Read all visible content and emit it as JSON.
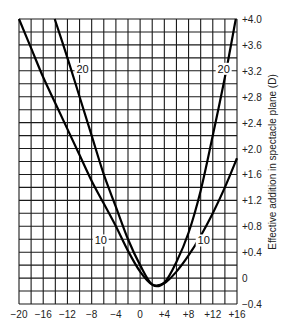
{
  "chart_data": {
    "type": "line",
    "title": "",
    "xlabel": "",
    "ylabel": "Effective addition in spectacle plane (D)",
    "xlim": [
      -20,
      16
    ],
    "ylim": [
      -0.4,
      4.0
    ],
    "grid": true,
    "x_grid_step": 2,
    "y_grid_step": 0.2,
    "x_ticks": [
      -20,
      -16,
      -12,
      -8,
      -4,
      0,
      4,
      8,
      12,
      16
    ],
    "x_tick_labels": [
      "−20",
      "−16",
      "−12",
      "−8",
      "−4",
      "0",
      "+4",
      "+8",
      "+12",
      "+16"
    ],
    "y_ticks": [
      4.0,
      3.6,
      3.2,
      2.8,
      2.4,
      2.0,
      1.6,
      1.2,
      0.8,
      0.4,
      0,
      -0.4
    ],
    "y_tick_labels": [
      "+4.0",
      "+3.6",
      "+3.2",
      "+2.8",
      "+2.4",
      "+2.0",
      "+1.6",
      "+1.2",
      "+0.8",
      "+0.4",
      "0",
      "−0.4"
    ],
    "y_axis_position": "right",
    "series": [
      {
        "name": "10",
        "label_pos": {
          "x": -6.5,
          "y": 0.55
        },
        "label_pos2": {
          "x": 10.5,
          "y": 0.55
        },
        "x": [
          -20,
          -18,
          -16,
          -14,
          -12,
          -10,
          -8,
          -6,
          -4,
          -2,
          0,
          2,
          4,
          6,
          8,
          10,
          12,
          14,
          16
        ],
        "values": [
          4.0,
          3.55,
          3.1,
          2.7,
          2.3,
          1.9,
          1.5,
          1.15,
          0.8,
          0.42,
          0.1,
          -0.1,
          -0.08,
          0.1,
          0.35,
          0.65,
          1.0,
          1.4,
          1.85
        ]
      },
      {
        "name": "20",
        "label_pos": {
          "x": -9.5,
          "y": 3.2
        },
        "label_pos2": {
          "x": 13.8,
          "y": 3.2
        },
        "x": [
          -14.1,
          -12,
          -10,
          -8,
          -6,
          -4,
          -2,
          0,
          2,
          4,
          6,
          8,
          10,
          12,
          14,
          15.8
        ],
        "values": [
          4.0,
          3.4,
          2.8,
          2.2,
          1.6,
          1.1,
          0.6,
          0.2,
          -0.1,
          -0.07,
          0.25,
          0.7,
          1.35,
          2.2,
          3.1,
          4.0
        ]
      }
    ]
  }
}
